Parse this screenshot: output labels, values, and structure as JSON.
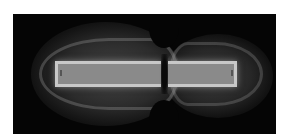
{
  "image": {
    "subject": "field visualization around a split bar magnet (two glowing lobes with dark pinch in center)",
    "background_color": "#ffffff",
    "frame_color": "#050505",
    "glow_color": "#8a8a8a",
    "bar_outline_color": "#c8c8c8"
  }
}
